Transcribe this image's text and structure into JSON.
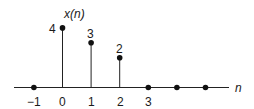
{
  "chart_data": {
    "type": "stem",
    "title": "x(n)",
    "xlabel": "n",
    "ylabel": "x(n)",
    "x": [
      -1,
      0,
      1,
      2,
      3,
      4,
      5
    ],
    "values": [
      0,
      4,
      3,
      2,
      0,
      0,
      0
    ],
    "tick_labels": [
      "-1",
      "0",
      "1",
      "2",
      "3"
    ],
    "value_labels": [
      {
        "n": 0,
        "label": "4"
      },
      {
        "n": 1,
        "label": "3"
      },
      {
        "n": 2,
        "label": "2"
      }
    ],
    "grid": false,
    "ylim": [
      0,
      4
    ]
  },
  "labels": {
    "y_axis": "x(n)",
    "x_axis": "n",
    "ticks": [
      "−1",
      "0",
      "1",
      "2",
      "3"
    ],
    "values": [
      "4",
      "3",
      "2"
    ]
  }
}
